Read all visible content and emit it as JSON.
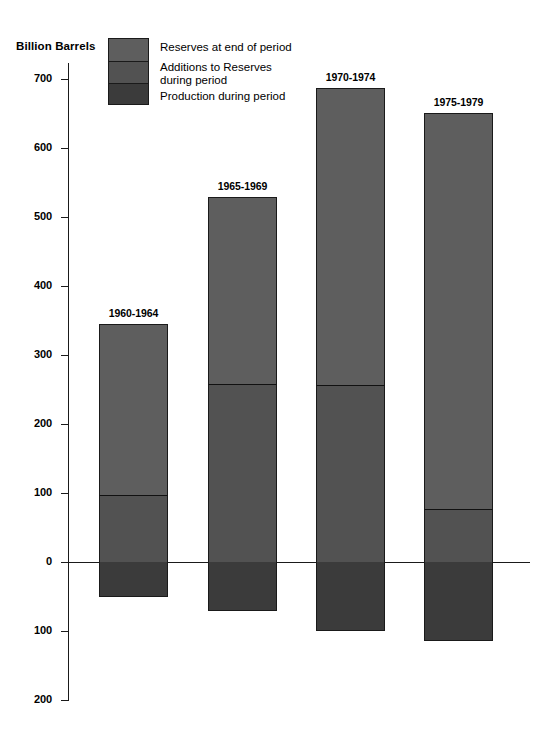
{
  "chart_data": {
    "type": "bar",
    "title": "",
    "subtitle": "",
    "xlabel": "",
    "ylabel": "Billion Barrels",
    "ylim": [
      -200,
      730
    ],
    "grid": false,
    "legend_position": "top-left",
    "stacked": true,
    "categories": [
      "1960-1964",
      "1965-1969",
      "1970-1974",
      "1975-1979"
    ],
    "series": [
      {
        "name": "Reserves at end of period",
        "color": "#5e5e5e",
        "values": [
          345,
          529,
          687,
          651
        ]
      },
      {
        "name": "Additions to Reserves during period",
        "color": "#525252",
        "values": [
          97,
          258,
          257,
          77
        ]
      },
      {
        "name": "Production during period",
        "color": "#3b3b3b",
        "values": [
          -51,
          -71,
          -100,
          -114
        ]
      }
    ],
    "y_ticks": [
      {
        "value": 700,
        "label": "700"
      },
      {
        "value": 600,
        "label": "600"
      },
      {
        "value": 500,
        "label": "500"
      },
      {
        "value": 400,
        "label": "400"
      },
      {
        "value": 300,
        "label": "300"
      },
      {
        "value": 200,
        "label": "200"
      },
      {
        "value": 100,
        "label": "100"
      },
      {
        "value": 0,
        "label": "0"
      },
      {
        "value": -100,
        "label": "100"
      },
      {
        "value": -200,
        "label": "200"
      }
    ]
  },
  "axis": {
    "y_title": "Billion Barrels"
  },
  "legend": {
    "items": [
      {
        "label": "Reserves at end of period",
        "color": "#5e5e5e"
      },
      {
        "label": "Additions to Reserves\nduring period",
        "color": "#525252"
      },
      {
        "label": "Production during period",
        "color": "#3b3b3b"
      }
    ]
  },
  "colors": {
    "reserves": "#5e5e5e",
    "additions": "#525252",
    "production": "#3b3b3b",
    "axis": "#1a1a1a",
    "background": "#ffffff",
    "text": "#000000"
  }
}
